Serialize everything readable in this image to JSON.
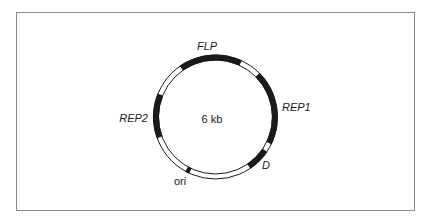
{
  "diagram": {
    "title_center": "6 kb",
    "plasmid_size_kb": 6,
    "genes": [
      {
        "name": "FLP",
        "start_deg": 325,
        "end_deg": 25,
        "filled": true
      },
      {
        "name": "REP1",
        "start_deg": 45,
        "end_deg": 116,
        "filled": true
      },
      {
        "name": "D",
        "start_deg": 124,
        "end_deg": 146,
        "filled": true
      },
      {
        "name": "REP2",
        "start_deg": 250,
        "end_deg": 292,
        "filled": true
      }
    ],
    "markers": [
      {
        "name": "ori",
        "angle_deg": 207
      }
    ],
    "labels": {
      "flp": "FLP",
      "rep1": "REP1",
      "rep2": "REP2",
      "d": "D",
      "ori": "ori",
      "size": "6 kb"
    },
    "colors": {
      "gene_fill": "#1a1a1a",
      "backbone_stroke": "#1a1a1a",
      "frame_border": "#8a8a8a"
    }
  }
}
